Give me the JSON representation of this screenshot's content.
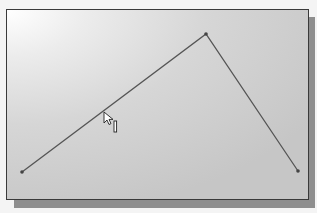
{
  "viewport": {
    "label": "sketch-viewport",
    "frame": {
      "x": 6,
      "y": 9,
      "width": 303,
      "height": 191
    },
    "border_color": "#3a3a3a",
    "shadow_color": "#8e8e8e",
    "background_gradient": [
      "#ffffff",
      "#ececec",
      "#d6d6d6",
      "#c6c6c6"
    ]
  },
  "sketch": {
    "polyline_points": [
      {
        "name": "start-point",
        "x": 21,
        "y": 171
      },
      {
        "name": "apex-point",
        "x": 205,
        "y": 33
      },
      {
        "name": "end-point",
        "x": 297,
        "y": 170
      }
    ],
    "line_color": "#555555",
    "point_color": "#444444"
  },
  "cursor": {
    "icon": "arrow-pointer-icon",
    "x": 103,
    "y": 111,
    "constraint_icon": "vertical-bar-icon",
    "constraint_x": 113,
    "constraint_y": 120
  }
}
